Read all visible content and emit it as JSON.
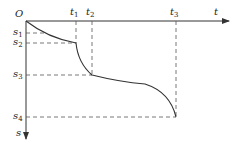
{
  "diagram": {
    "origin_label": "O",
    "x_axis_label": "t",
    "y_axis_label": "s",
    "t_ticks": [
      {
        "base": "t",
        "sub": "1"
      },
      {
        "base": "t",
        "sub": "2"
      },
      {
        "base": "t",
        "sub": "3"
      }
    ],
    "s_ticks": [
      {
        "base": "s",
        "sub": "1"
      },
      {
        "base": "s",
        "sub": "2"
      },
      {
        "base": "s",
        "sub": "3"
      },
      {
        "base": "s",
        "sub": "4"
      }
    ],
    "line_color": "#333333",
    "dash_color": "#555555"
  }
}
